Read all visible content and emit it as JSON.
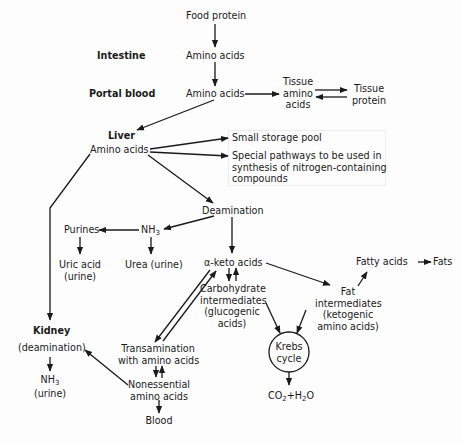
{
  "diagram": {
    "row_labels": {
      "intestine": "Intestine",
      "portal_blood": "Portal blood",
      "liver": "Liver",
      "kidney": "Kidney"
    },
    "nodes": {
      "food_protein": "Food protein",
      "amino_acids_intestine": "Amino acids",
      "amino_acids_portal": "Amino acids",
      "tissue_amino_acids_1": "Tissue",
      "tissue_amino_acids_2": "amino",
      "tissue_amino_acids_3": "acids",
      "tissue_protein_1": "Tissue",
      "tissue_protein_2": "protein",
      "amino_acids_liver": "Amino acids",
      "small_storage_pool": "Small storage pool",
      "special_pathways_1": "Special pathways to be used in",
      "special_pathways_2": "synthesis of nitrogen-containing",
      "special_pathways_3": "compounds",
      "deamination": "Deamination",
      "nh3": "NH",
      "nh3_sub": "3",
      "purines": "Purines",
      "uric_acid_1": "Uric acid",
      "uric_acid_2": "(urine)",
      "urea": "Urea (urine)",
      "alpha_keto_acids": "α-keto acids",
      "carbohydrate_1": "Carbohydrate",
      "carbohydrate_2": "intermediates",
      "carbohydrate_3": "(glucogenic",
      "carbohydrate_4": "acids)",
      "fatty_acids": "Fatty acids",
      "fats": "Fats",
      "fat_intermediates_1": "Fat",
      "fat_intermediates_2": "intermediates",
      "fat_intermediates_3": "(ketogenic",
      "fat_intermediates_4": "amino acids)",
      "krebs_1": "Krebs",
      "krebs_2": "cycle",
      "co2_h2o_a": "CO",
      "co2_h2o_b": "2",
      "co2_h2o_c": "+H",
      "co2_h2o_d": "2",
      "co2_h2o_e": "O",
      "kidney_deamination": "(deamination)",
      "kidney_nh3": "NH",
      "kidney_nh3_sub": "3",
      "kidney_urine": "(urine)",
      "transamination_1": "Transamination",
      "transamination_2": "with amino acids",
      "nonessential_1": "Nonessential",
      "nonessential_2": "amino acids",
      "blood": "Blood"
    },
    "colors": {
      "ink": "#1a1a1a",
      "paper": "#fdfdfd"
    }
  }
}
